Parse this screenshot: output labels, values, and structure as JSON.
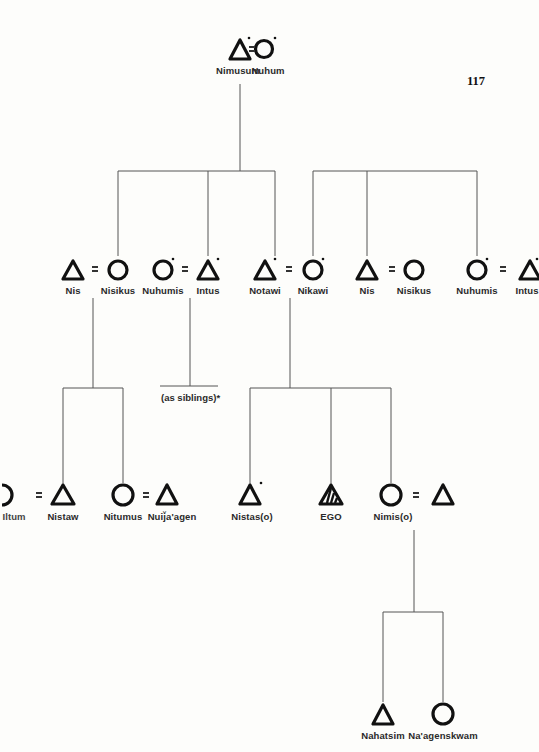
{
  "page": {
    "number": "117"
  },
  "legend_symbols": {
    "male": "triangle-icon",
    "female": "circle-icon",
    "marriage": "equals-sign",
    "ego": "hatched-triangle-icon",
    "deceased_or_marked": "dot-marker"
  },
  "generation_1": {
    "couple": [
      {
        "name": "Nimusum",
        "sex": "male",
        "dot": true
      },
      {
        "name": "Nuhum",
        "sex": "female",
        "dot": true
      }
    ]
  },
  "generation_2": {
    "people": [
      {
        "name": "Nis",
        "sex": "male",
        "dot": false
      },
      {
        "name": "Nisikus",
        "sex": "female",
        "dot": false
      },
      {
        "name": "Nuhumis",
        "sex": "female",
        "dot": true
      },
      {
        "name": "Intus",
        "sex": "male",
        "dot": true
      },
      {
        "name": "Notawi",
        "sex": "male",
        "dot": true
      },
      {
        "name": "Nikawi",
        "sex": "female",
        "dot": true
      },
      {
        "name": "Nis",
        "sex": "male",
        "dot": false
      },
      {
        "name": "Nisikus",
        "sex": "female",
        "dot": false
      },
      {
        "name": "Nuhumis",
        "sex": "female",
        "dot": true
      },
      {
        "name": "Intus",
        "sex": "male",
        "dot": true
      }
    ]
  },
  "generation_3": {
    "people": [
      {
        "name": "Iltum",
        "sex": "female",
        "dot": false,
        "partially_cropped": true
      },
      {
        "name": "Nistaw",
        "sex": "male",
        "dot": false
      },
      {
        "name": "Nitumus",
        "sex": "female",
        "dot": false
      },
      {
        "name": "Nuij̆a'agen",
        "sex": "male",
        "dot": false
      },
      {
        "name": "Nistas(o)",
        "sex": "male",
        "dot": true
      },
      {
        "name": "EGO",
        "sex": "ego",
        "dot": false
      },
      {
        "name": "Nimis(o)",
        "sex": "female",
        "dot": false
      },
      {
        "name": "",
        "sex": "male",
        "dot": false
      }
    ],
    "note": "(as siblings)*"
  },
  "generation_4": {
    "people": [
      {
        "name": "Nahatsim",
        "sex": "male"
      },
      {
        "name": "Na'agenskwam",
        "sex": "female"
      }
    ]
  }
}
